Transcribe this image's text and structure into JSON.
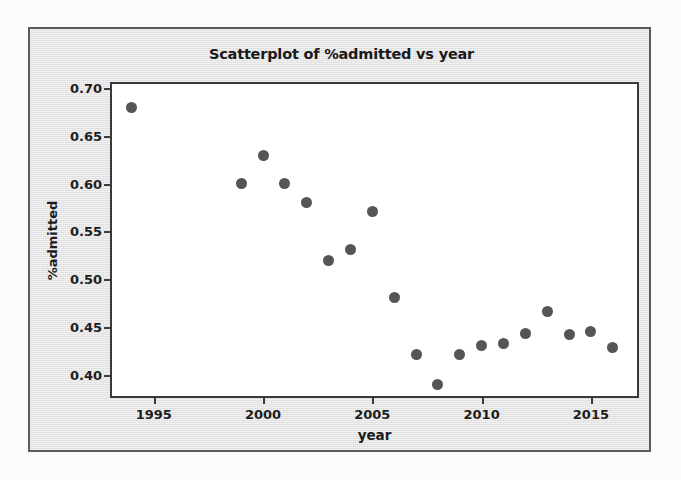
{
  "scan": {
    "ghost_text": "  ",
    "background_color": "#ebebeb",
    "page_color": "#fcfcfc",
    "border_color": "#5b5b5b"
  },
  "chart_data": {
    "type": "scatter",
    "title": "Scatterplot of %admitted vs year",
    "xlabel": "year",
    "ylabel": "%admitted",
    "grid": false,
    "legend": null,
    "marker_color": "#555555",
    "axis_color": "#3a3a3a",
    "plot_background": "#ffffff",
    "xlim": [
      1993.0,
      2017.2
    ],
    "ylim": [
      0.3755,
      0.7065
    ],
    "xticks": [
      1995,
      2000,
      2005,
      2010,
      2015
    ],
    "xtick_labels": [
      "1995",
      "2000",
      "2005",
      "2010",
      "2015"
    ],
    "yticks": [
      0.7,
      0.65,
      0.6,
      0.55,
      0.5,
      0.45,
      0.4
    ],
    "ytick_labels": [
      "0.70",
      "0.65",
      "0.60",
      "0.55",
      "0.50",
      "0.45",
      "0.40"
    ],
    "x": [
      1994,
      1999,
      2000,
      2001,
      2002,
      2003,
      2004,
      2005,
      2006,
      2007,
      2008,
      2009,
      2010,
      2011,
      2012,
      2013,
      2014,
      2015,
      2016
    ],
    "y": [
      0.68,
      0.6,
      0.63,
      0.6,
      0.58,
      0.52,
      0.531,
      0.571,
      0.481,
      0.421,
      0.39,
      0.421,
      0.431,
      0.433,
      0.443,
      0.466,
      0.442,
      0.445,
      0.428
    ],
    "points": [
      {
        "x": 1994,
        "y": 0.68
      },
      {
        "x": 1999,
        "y": 0.6
      },
      {
        "x": 2000,
        "y": 0.63
      },
      {
        "x": 2001,
        "y": 0.6
      },
      {
        "x": 2002,
        "y": 0.58
      },
      {
        "x": 2003,
        "y": 0.52
      },
      {
        "x": 2004,
        "y": 0.531
      },
      {
        "x": 2005,
        "y": 0.571
      },
      {
        "x": 2006,
        "y": 0.481
      },
      {
        "x": 2007,
        "y": 0.421
      },
      {
        "x": 2008,
        "y": 0.39
      },
      {
        "x": 2009,
        "y": 0.421
      },
      {
        "x": 2010,
        "y": 0.431
      },
      {
        "x": 2011,
        "y": 0.433
      },
      {
        "x": 2012,
        "y": 0.443
      },
      {
        "x": 2013,
        "y": 0.466
      },
      {
        "x": 2014,
        "y": 0.442
      },
      {
        "x": 2015,
        "y": 0.445
      },
      {
        "x": 2016,
        "y": 0.428
      }
    ]
  }
}
